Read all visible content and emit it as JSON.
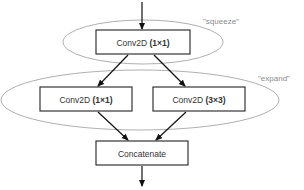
{
  "diagram": {
    "groups": {
      "squeeze": {
        "label": "\"squeeze\""
      },
      "expand": {
        "label": "\"expand\""
      }
    },
    "nodes": {
      "squeeze_conv": {
        "prefix": "Conv2D ",
        "param": "(1×1)"
      },
      "expand_conv_1x1": {
        "prefix": "Conv2D ",
        "param": "(1×1)"
      },
      "expand_conv_3x3": {
        "prefix": "Conv2D ",
        "param": "(3×3)"
      },
      "concat": {
        "label": "Concatenate"
      }
    },
    "edges": [
      {
        "from": "input",
        "to": "squeeze_conv"
      },
      {
        "from": "squeeze_conv",
        "to": "expand_conv_1x1"
      },
      {
        "from": "squeeze_conv",
        "to": "expand_conv_3x3"
      },
      {
        "from": "expand_conv_1x1",
        "to": "concat"
      },
      {
        "from": "expand_conv_3x3",
        "to": "concat"
      },
      {
        "from": "concat",
        "to": "output"
      }
    ],
    "colors": {
      "box_stroke": "#222222",
      "ellipse_stroke": "#9a9a9a",
      "label_text": "#8a8a8a",
      "node_text": "#333333"
    }
  }
}
